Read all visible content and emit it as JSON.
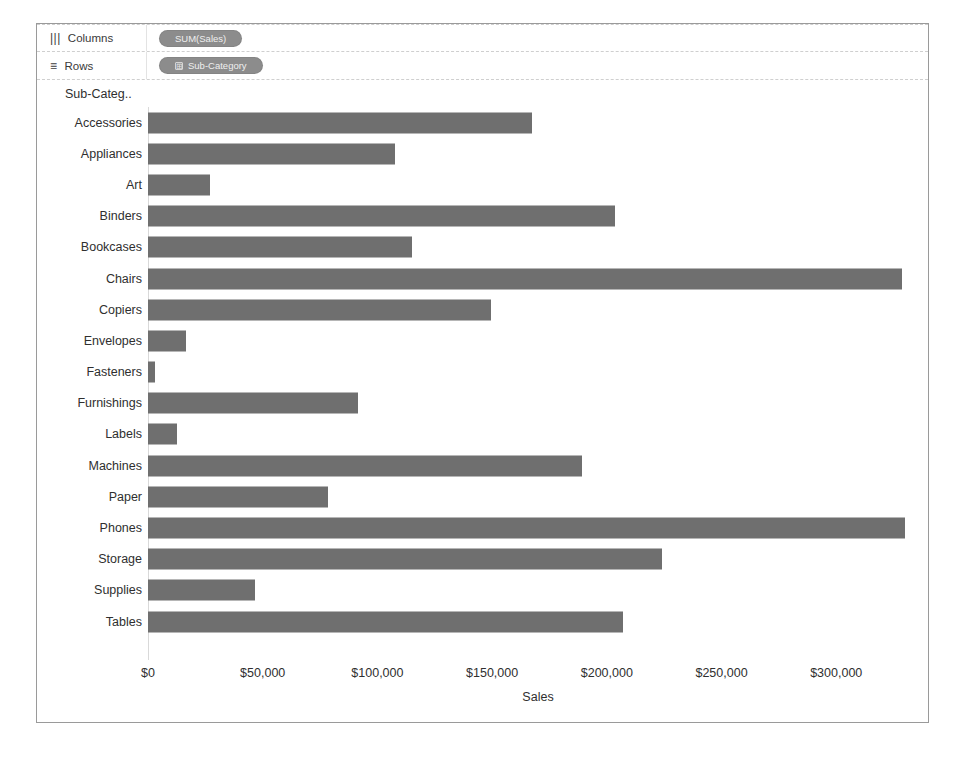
{
  "shelves": [
    {
      "icon": "columns-icon",
      "glyph": "|||",
      "label": "Columns",
      "pill": {
        "text": "SUM(Sales)",
        "has_icon": false,
        "icon_glyph": ""
      }
    },
    {
      "icon": "rows-icon",
      "glyph": "≡",
      "label": "Rows",
      "pill": {
        "text": "Sub-Category",
        "has_icon": true,
        "icon_glyph": "⊞"
      }
    }
  ],
  "header": {
    "row_field_title": "Sub-Categ.."
  },
  "colors": {
    "bar": "#6f6f6f",
    "pill": "#8c8c8c",
    "frame": "#9a9a9a",
    "text": "#2f2f2f"
  },
  "chart_data": {
    "type": "bar",
    "orientation": "horizontal",
    "title": "",
    "xlabel": "Sales",
    "ylabel": "Sub-Categ..",
    "xlim": [
      0,
      340000
    ],
    "xticks": [
      0,
      50000,
      100000,
      150000,
      200000,
      250000,
      300000
    ],
    "xtick_labels": [
      "$0",
      "$50,000",
      "$100,000",
      "$150,000",
      "$200,000",
      "$250,000",
      "$300,000"
    ],
    "grid": false,
    "legend": "none",
    "categories": [
      "Accessories",
      "Appliances",
      "Art",
      "Binders",
      "Bookcases",
      "Chairs",
      "Copiers",
      "Envelopes",
      "Fasteners",
      "Furnishings",
      "Labels",
      "Machines",
      "Paper",
      "Phones",
      "Storage",
      "Supplies",
      "Tables"
    ],
    "values": [
      167380,
      107532,
      27119,
      203413,
      114880,
      328449,
      149528,
      16476,
      3024,
      91705,
      12486,
      189239,
      78479,
      330007,
      223844,
      46674,
      206966
    ]
  }
}
